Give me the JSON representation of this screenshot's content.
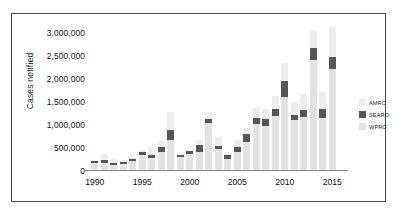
{
  "chart_data": {
    "type": "bar",
    "stacked": true,
    "title": "",
    "xlabel": "",
    "ylabel": "Cases notified",
    "ylim": [
      0,
      3100000
    ],
    "ytick_labels": [
      "0",
      "500,000",
      "1,000,000",
      "1,500,000",
      "2,000,000",
      "2,500,000",
      "3,000,000"
    ],
    "ytick_values": [
      0,
      500000,
      1000000,
      1500000,
      2000000,
      2500000,
      3000000
    ],
    "grid": false,
    "legend_position": "right",
    "categories": [
      1990,
      1991,
      1992,
      1993,
      1994,
      1995,
      1996,
      1997,
      1998,
      1999,
      2000,
      2001,
      2002,
      2003,
      2004,
      2005,
      2006,
      2007,
      2008,
      2009,
      2010,
      2011,
      2012,
      2013,
      2014,
      2015
    ],
    "xtick_labels": [
      "1990",
      "1995",
      "2000",
      "2005",
      "2010",
      "2015"
    ],
    "xtick_values": [
      1990,
      1995,
      2000,
      2005,
      2010,
      2015
    ],
    "series": [
      {
        "name": "WPRO",
        "color": "#e2e2e2",
        "values": [
          150000,
          160000,
          110000,
          125000,
          185000,
          330000,
          265000,
          400000,
          640000,
          290000,
          355000,
          380000,
          1020000,
          450000,
          240000,
          400000,
          600000,
          990000,
          960000,
          1180000,
          1580000,
          1090000,
          1150000,
          2390000,
          1130000,
          2180000
        ]
      },
      {
        "name": "SEARO",
        "color": "#555658",
        "values": [
          55000,
          55000,
          45000,
          45000,
          45000,
          70000,
          65000,
          90000,
          225000,
          40000,
          55000,
          155000,
          90000,
          65000,
          85000,
          110000,
          190000,
          130000,
          150000,
          150000,
          340000,
          100000,
          155000,
          255000,
          185000,
          260000
        ]
      },
      {
        "name": "AMRO",
        "color": "#ededed",
        "values": [
          15000,
          140000,
          90000,
          25000,
          40000,
          35000,
          145000,
          140000,
          385000,
          0,
          30000,
          115000,
          120000,
          200000,
          20000,
          145000,
          120000,
          230000,
          215000,
          270000,
          390000,
          275000,
          340000,
          375000,
          375000,
          655000
        ]
      }
    ],
    "legend_entries": [
      {
        "label": "AMRO",
        "color": "#ededed"
      },
      {
        "label": "SEARO",
        "color": "#555658"
      },
      {
        "label": "WPRO",
        "color": "#e2e2e2"
      }
    ]
  }
}
